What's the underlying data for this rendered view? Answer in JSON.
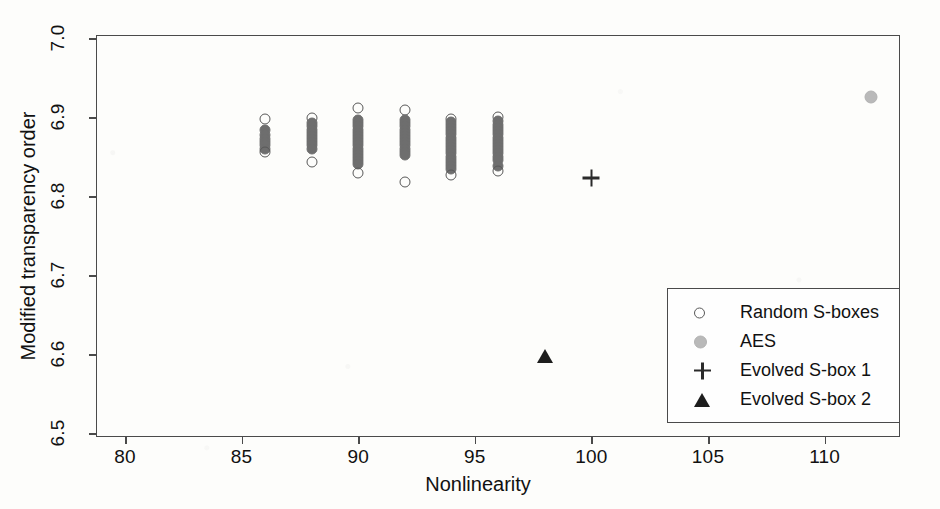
{
  "chart_data": {
    "type": "scatter",
    "title": "",
    "xlabel": "Nonlinearity",
    "ylabel": "Modified transparency order",
    "xlim": [
      78.8,
      113.2
    ],
    "ylim": [
      6.5,
      7.0
    ],
    "xticks": [
      "80",
      "85",
      "90",
      "95",
      "100",
      "105",
      "110"
    ],
    "yticks": [
      "6.5",
      "6.6",
      "6.7",
      "6.8",
      "6.9",
      "7.0"
    ],
    "grid": false,
    "legend_position": "lower-right",
    "series": [
      {
        "name": "Random S-boxes",
        "marker": "open-circle",
        "color": "#585858",
        "points": [
          {
            "x": 86,
            "y": 6.897
          },
          {
            "x": 86,
            "y": 6.884
          },
          {
            "x": 86,
            "y": 6.877
          },
          {
            "x": 86,
            "y": 6.872
          },
          {
            "x": 86,
            "y": 6.868
          },
          {
            "x": 86,
            "y": 6.864
          },
          {
            "x": 86,
            "y": 6.86
          },
          {
            "x": 86,
            "y": 6.856
          },
          {
            "x": 88,
            "y": 6.899
          },
          {
            "x": 88,
            "y": 6.893
          },
          {
            "x": 88,
            "y": 6.888
          },
          {
            "x": 88,
            "y": 6.884
          },
          {
            "x": 88,
            "y": 6.88
          },
          {
            "x": 88,
            "y": 6.876
          },
          {
            "x": 88,
            "y": 6.872
          },
          {
            "x": 88,
            "y": 6.868
          },
          {
            "x": 88,
            "y": 6.864
          },
          {
            "x": 88,
            "y": 6.86
          },
          {
            "x": 88,
            "y": 6.843
          },
          {
            "x": 90,
            "y": 6.911
          },
          {
            "x": 90,
            "y": 6.896
          },
          {
            "x": 90,
            "y": 6.892
          },
          {
            "x": 90,
            "y": 6.888
          },
          {
            "x": 90,
            "y": 6.884
          },
          {
            "x": 90,
            "y": 6.88
          },
          {
            "x": 90,
            "y": 6.876
          },
          {
            "x": 90,
            "y": 6.872
          },
          {
            "x": 90,
            "y": 6.868
          },
          {
            "x": 90,
            "y": 6.864
          },
          {
            "x": 90,
            "y": 6.86
          },
          {
            "x": 90,
            "y": 6.856
          },
          {
            "x": 90,
            "y": 6.852
          },
          {
            "x": 90,
            "y": 6.848
          },
          {
            "x": 90,
            "y": 6.844
          },
          {
            "x": 90,
            "y": 6.84
          },
          {
            "x": 90,
            "y": 6.829
          },
          {
            "x": 92,
            "y": 6.909
          },
          {
            "x": 92,
            "y": 6.896
          },
          {
            "x": 92,
            "y": 6.892
          },
          {
            "x": 92,
            "y": 6.888
          },
          {
            "x": 92,
            "y": 6.884
          },
          {
            "x": 92,
            "y": 6.88
          },
          {
            "x": 92,
            "y": 6.876
          },
          {
            "x": 92,
            "y": 6.872
          },
          {
            "x": 92,
            "y": 6.868
          },
          {
            "x": 92,
            "y": 6.864
          },
          {
            "x": 92,
            "y": 6.86
          },
          {
            "x": 92,
            "y": 6.856
          },
          {
            "x": 92,
            "y": 6.852
          },
          {
            "x": 92,
            "y": 6.818
          },
          {
            "x": 94,
            "y": 6.898
          },
          {
            "x": 94,
            "y": 6.894
          },
          {
            "x": 94,
            "y": 6.89
          },
          {
            "x": 94,
            "y": 6.886
          },
          {
            "x": 94,
            "y": 6.882
          },
          {
            "x": 94,
            "y": 6.878
          },
          {
            "x": 94,
            "y": 6.874
          },
          {
            "x": 94,
            "y": 6.87
          },
          {
            "x": 94,
            "y": 6.866
          },
          {
            "x": 94,
            "y": 6.862
          },
          {
            "x": 94,
            "y": 6.858
          },
          {
            "x": 94,
            "y": 6.854
          },
          {
            "x": 94,
            "y": 6.85
          },
          {
            "x": 94,
            "y": 6.846
          },
          {
            "x": 94,
            "y": 6.842
          },
          {
            "x": 94,
            "y": 6.838
          },
          {
            "x": 94,
            "y": 6.834
          },
          {
            "x": 94,
            "y": 6.826
          },
          {
            "x": 96,
            "y": 6.9
          },
          {
            "x": 96,
            "y": 6.895
          },
          {
            "x": 96,
            "y": 6.89
          },
          {
            "x": 96,
            "y": 6.886
          },
          {
            "x": 96,
            "y": 6.882
          },
          {
            "x": 96,
            "y": 6.878
          },
          {
            "x": 96,
            "y": 6.874
          },
          {
            "x": 96,
            "y": 6.87
          },
          {
            "x": 96,
            "y": 6.866
          },
          {
            "x": 96,
            "y": 6.862
          },
          {
            "x": 96,
            "y": 6.858
          },
          {
            "x": 96,
            "y": 6.854
          },
          {
            "x": 96,
            "y": 6.85
          },
          {
            "x": 96,
            "y": 6.846
          },
          {
            "x": 96,
            "y": 6.838
          },
          {
            "x": 96,
            "y": 6.832
          }
        ]
      },
      {
        "name": "AES",
        "marker": "filled-circle-gray",
        "color": "#b9b9b9",
        "points": [
          {
            "x": 112,
            "y": 6.925
          }
        ]
      },
      {
        "name": "Evolved S-box 1",
        "marker": "plus",
        "color": "#2a2a2a",
        "points": [
          {
            "x": 100,
            "y": 6.823
          }
        ]
      },
      {
        "name": "Evolved S-box 2",
        "marker": "filled-triangle",
        "color": "#1d1d1d",
        "points": [
          {
            "x": 98,
            "y": 6.598
          }
        ]
      }
    ]
  },
  "legend": {
    "entries": [
      {
        "label": "Random S-boxes",
        "marker": "open-circle"
      },
      {
        "label": "AES",
        "marker": "filled-circle-gray"
      },
      {
        "label": "Evolved S-box 1",
        "marker": "plus"
      },
      {
        "label": "Evolved S-box 2",
        "marker": "filled-triangle"
      }
    ]
  }
}
